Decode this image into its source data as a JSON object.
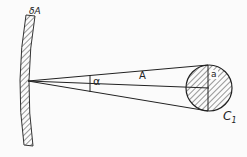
{
  "diagram": {
    "labels": {
      "surface": "δA",
      "angle": "α",
      "distance": "A",
      "radius": "a",
      "circle": "C",
      "circle_sub": "1"
    },
    "colors": {
      "ink": "#222222",
      "background": "#fbfbfb"
    }
  }
}
